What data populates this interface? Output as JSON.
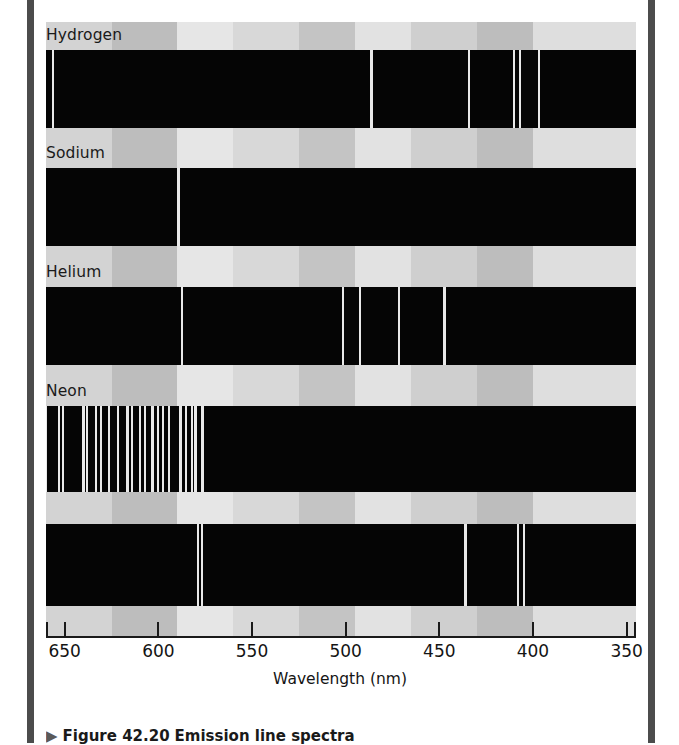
{
  "figure": {
    "axis": {
      "title": "Wavelength (nm)",
      "ticks": [
        650,
        600,
        550,
        500,
        450,
        400,
        350
      ],
      "tick_labels": [
        "650",
        "600",
        "550",
        "500",
        "450",
        "400",
        "350"
      ],
      "range_nm": [
        660,
        345
      ],
      "direction": "decreasing-left-to-right"
    },
    "caption": {
      "marker": "▶",
      "number": "Figure 42.20",
      "text": "Emission line spectra"
    },
    "spectra": [
      {
        "label": "Hydrogen",
        "lines_nm": [
          656.3,
          486.1,
          434.0,
          410.2,
          407.0,
          397.0
        ],
        "line_widths_px": [
          2,
          3,
          2,
          2,
          2,
          2
        ]
      },
      {
        "label": "Sodium",
        "lines_nm": [
          589.6,
          589.0
        ],
        "line_widths_px": [
          2,
          2
        ]
      },
      {
        "label": "Helium",
        "lines_nm": [
          667.8,
          587.6,
          501.6,
          492.2,
          471.3,
          447.1
        ],
        "line_widths_px": [
          2,
          2,
          2,
          2,
          2,
          3
        ]
      },
      {
        "label": "Neon",
        "lines_nm": [
          659.9,
          653.3,
          650.7,
          640.2,
          638.3,
          633.4,
          630.5,
          626.6,
          621.7,
          616.4,
          614.3,
          609.6,
          607.4,
          603.0,
          600.0,
          597.6,
          594.5,
          588.2,
          585.2,
          582.0,
          580.4,
          576.4
        ],
        "line_widths_px": [
          2,
          2,
          2,
          3,
          2,
          2,
          2,
          2,
          2,
          3,
          2,
          2,
          2,
          3,
          2,
          2,
          2,
          3,
          2,
          2,
          3,
          3
        ]
      },
      {
        "label": "",
        "lines_nm": [
          579.1,
          576.9,
          435.8,
          407.8,
          404.7
        ],
        "line_widths_px": [
          2,
          2,
          3,
          2,
          2
        ]
      }
    ],
    "background_bands": [
      {
        "color": "#d3d3d3",
        "from_nm": 660,
        "to_nm": 625
      },
      {
        "color": "#bdbdbd",
        "from_nm": 625,
        "to_nm": 590
      },
      {
        "color": "#e6e6e6",
        "from_nm": 590,
        "to_nm": 560
      },
      {
        "color": "#d8d8d8",
        "from_nm": 560,
        "to_nm": 525
      },
      {
        "color": "#c4c4c4",
        "from_nm": 525,
        "to_nm": 495
      },
      {
        "color": "#e2e2e2",
        "from_nm": 495,
        "to_nm": 465
      },
      {
        "color": "#cfcfcf",
        "from_nm": 465,
        "to_nm": 430
      },
      {
        "color": "#bdbdbd",
        "from_nm": 430,
        "to_nm": 400
      },
      {
        "color": "#dedede",
        "from_nm": 400,
        "to_nm": 345
      }
    ]
  }
}
